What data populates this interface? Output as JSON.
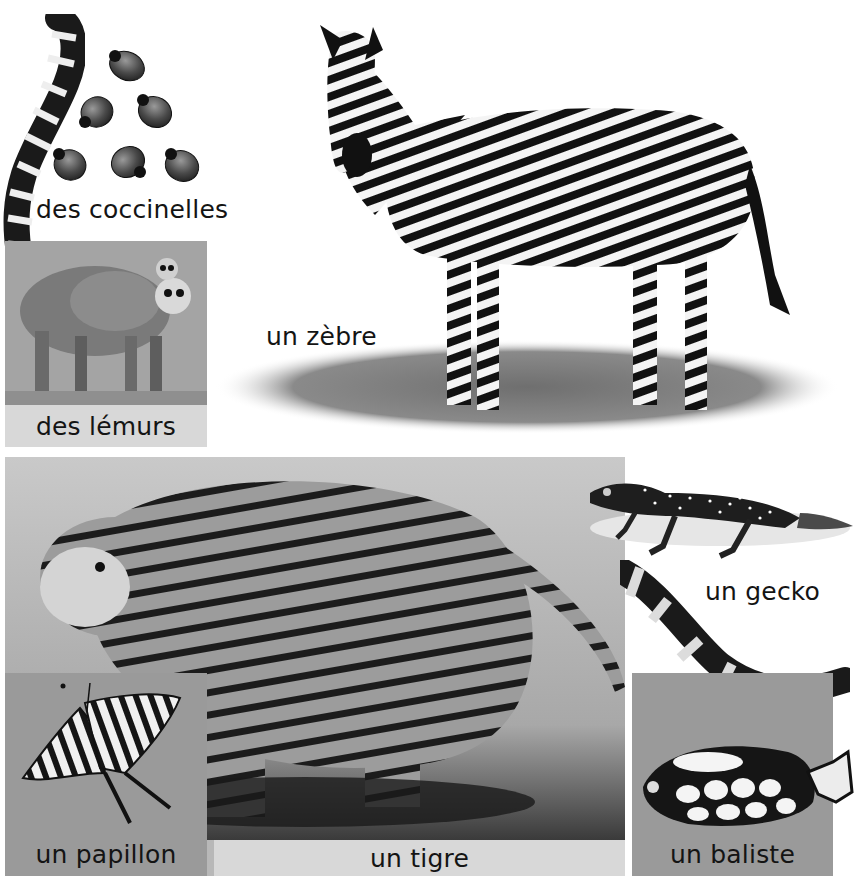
{
  "page": {
    "type": "picture-dictionary-page",
    "colors": {
      "background": "#ffffff",
      "panel_grey": "#9a9a9a",
      "caption_band": "#d8d8d8",
      "text": "#141414"
    }
  },
  "entries": [
    {
      "id": "ladybirds",
      "label": "des coccinelles",
      "subject": "ladybird-beetles"
    },
    {
      "id": "lemurs",
      "label": "des lémurs",
      "subject": "ring-tailed-lemurs"
    },
    {
      "id": "zebra",
      "label": "un zèbre",
      "subject": "zebra"
    },
    {
      "id": "tiger",
      "label": "un tigre",
      "subject": "tiger"
    },
    {
      "id": "gecko",
      "label": "un gecko",
      "subject": "gecko"
    },
    {
      "id": "butterfly",
      "label": "un papillon",
      "subject": "swallowtail-butterfly"
    },
    {
      "id": "triggerfish",
      "label": "un baliste",
      "subject": "clown-triggerfish"
    }
  ]
}
